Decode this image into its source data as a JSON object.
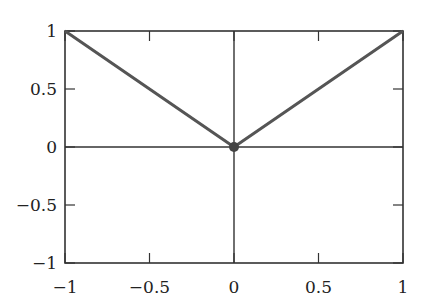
{
  "chart_data": {
    "type": "line",
    "title": "",
    "xlabel": "",
    "ylabel": "",
    "xlim": [
      -1,
      1
    ],
    "ylim": [
      -1,
      1
    ],
    "grid": false,
    "axes_lines_through_origin": true,
    "series": [
      {
        "name": "|x|",
        "x": [
          -1,
          0,
          1
        ],
        "y": [
          1,
          0,
          1
        ],
        "color": "#555555"
      }
    ],
    "points": [
      {
        "x": 0,
        "y": 0,
        "marker": "filled-circle",
        "color": "#444444"
      }
    ],
    "x_ticks": [
      -1,
      -0.5,
      0,
      0.5,
      1
    ],
    "y_ticks": [
      -1,
      -0.5,
      0,
      0.5,
      1
    ],
    "x_tick_labels": [
      "−1",
      "−0.5",
      "0",
      "0.5",
      "1"
    ],
    "y_tick_labels": [
      "−1",
      "−0.5",
      "0",
      "0.5",
      "1"
    ]
  }
}
